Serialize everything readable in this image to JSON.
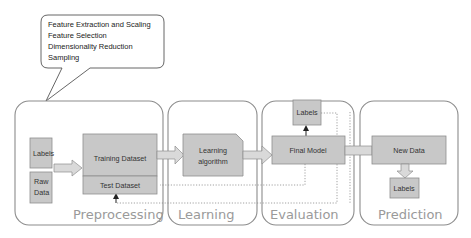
{
  "colors": {
    "panel_stroke": "#8c8c8c",
    "box_fill": "#c8c8c8",
    "box_stroke": "#8e8e8e",
    "phase_label": "#9a9a9a",
    "arrow_fill": "#d9d9d9",
    "dotted_line": "#8a8a8a"
  },
  "callout": {
    "lines": [
      "Feature Extraction and Scaling",
      "Feature Selection",
      "Dimensionality Reduction",
      "Sampling"
    ]
  },
  "phases": [
    {
      "id": "preprocessing",
      "label": "Preprocessing"
    },
    {
      "id": "learning",
      "label": "Learning"
    },
    {
      "id": "evaluation",
      "label": "Evaluation"
    },
    {
      "id": "prediction",
      "label": "Prediction"
    }
  ],
  "nodes": {
    "pre_labels": "Labels",
    "raw_data_1": "Raw",
    "raw_data_2": "Data",
    "training_dataset": "Training Dataset",
    "test_dataset": "Test Dataset",
    "learning_algorithm_1": "Learning",
    "learning_algorithm_2": "algorithm",
    "final_model": "Final Model",
    "eval_labels": "Labels",
    "new_data": "New Data",
    "pred_labels": "Labels"
  }
}
